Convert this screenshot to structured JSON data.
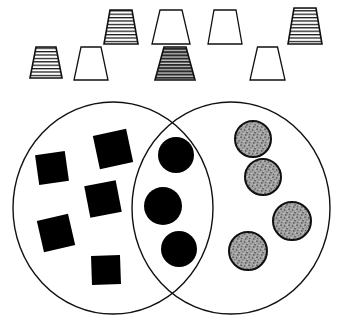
{
  "figure": {
    "background_color": "#ffffff",
    "stroke_color": "#111111",
    "width": 341,
    "height": 327
  },
  "trapezoid_row": {
    "name": "trapezoid-row",
    "count": 8,
    "fill_legend": {
      "hatched": "horizontal line hatching, white ground",
      "dark_hatched": "dense dark horizontal hatching",
      "plain": "white, no fill"
    },
    "items": [
      {
        "id": "trapezoid-1",
        "fill": "hatched",
        "row": "bottom",
        "x": 30,
        "y": 47,
        "top_width": 20,
        "bottom_width": 32,
        "height": 31,
        "label": "hatched trapezoid"
      },
      {
        "id": "trapezoid-2",
        "fill": "plain",
        "row": "bottom",
        "x": 74,
        "y": 47,
        "top_width": 20,
        "bottom_width": 34,
        "height": 33,
        "label": "plain trapezoid"
      },
      {
        "id": "trapezoid-3",
        "fill": "hatched",
        "row": "top",
        "x": 104,
        "y": 10,
        "top_width": 22,
        "bottom_width": 34,
        "height": 34,
        "label": "hatched trapezoid"
      },
      {
        "id": "trapezoid-4",
        "fill": "plain",
        "row": "top",
        "x": 152,
        "y": 10,
        "top_width": 22,
        "bottom_width": 38,
        "height": 34,
        "label": "plain trapezoid"
      },
      {
        "id": "trapezoid-5",
        "fill": "plain",
        "row": "top",
        "x": 208,
        "y": 10,
        "top_width": 22,
        "bottom_width": 34,
        "height": 34,
        "label": "plain trapezoid"
      },
      {
        "id": "trapezoid-6",
        "fill": "dark_hatched",
        "row": "bottom",
        "x": 155,
        "y": 47,
        "top_width": 22,
        "bottom_width": 40,
        "height": 33,
        "label": "dark hatched trapezoid"
      },
      {
        "id": "trapezoid-7",
        "fill": "plain",
        "row": "bottom",
        "x": 250,
        "y": 47,
        "top_width": 20,
        "bottom_width": 35,
        "height": 33,
        "label": "plain trapezoid"
      },
      {
        "id": "trapezoid-8",
        "fill": "hatched",
        "row": "top",
        "x": 288,
        "y": 8,
        "top_width": 22,
        "bottom_width": 34,
        "height": 36,
        "label": "hatched trapezoid"
      }
    ]
  },
  "venn": {
    "name": "venn-diagram",
    "left_set": {
      "id": "left-ellipse",
      "cx": 113,
      "cy": 208,
      "rx": 100,
      "ry": 106,
      "label": "left set"
    },
    "right_set": {
      "id": "right-ellipse",
      "cx": 231,
      "cy": 208,
      "rx": 99,
      "ry": 106,
      "label": "right set"
    },
    "regions": {
      "left_only": {
        "label": "left only region",
        "item_shape": "square",
        "item_fill": "#000000",
        "count": 5,
        "items": [
          {
            "id": "square-1",
            "cx": 52,
            "cy": 168,
            "size": 30,
            "rotation": -8
          },
          {
            "id": "square-2",
            "cx": 113,
            "cy": 149,
            "size": 34,
            "rotation": -12
          },
          {
            "id": "square-3",
            "cx": 103,
            "cy": 199,
            "size": 32,
            "rotation": -11
          },
          {
            "id": "square-4",
            "cx": 56,
            "cy": 233,
            "size": 32,
            "rotation": -13
          },
          {
            "id": "square-5",
            "cx": 106,
            "cy": 270,
            "size": 29,
            "rotation": -2
          }
        ]
      },
      "intersection": {
        "label": "intersection region",
        "item_shape": "circle",
        "item_fill": "#000000",
        "count": 3,
        "items": [
          {
            "id": "circle-1",
            "cx": 176,
            "cy": 155,
            "r": 18
          },
          {
            "id": "circle-2",
            "cx": 163,
            "cy": 206,
            "r": 19
          },
          {
            "id": "circle-3",
            "cx": 179,
            "cy": 249,
            "r": 18
          }
        ]
      },
      "right_only": {
        "label": "right only region",
        "item_shape": "circle",
        "item_fill": "#9a9a9a",
        "item_texture": "stippled",
        "count": 4,
        "items": [
          {
            "id": "stipple-circle-1",
            "cx": 253,
            "cy": 139,
            "r": 18
          },
          {
            "id": "stipple-circle-2",
            "cx": 263,
            "cy": 177,
            "r": 18
          },
          {
            "id": "stipple-circle-3",
            "cx": 292,
            "cy": 221,
            "r": 19
          },
          {
            "id": "stipple-circle-4",
            "cx": 248,
            "cy": 251,
            "r": 19
          }
        ]
      }
    }
  }
}
